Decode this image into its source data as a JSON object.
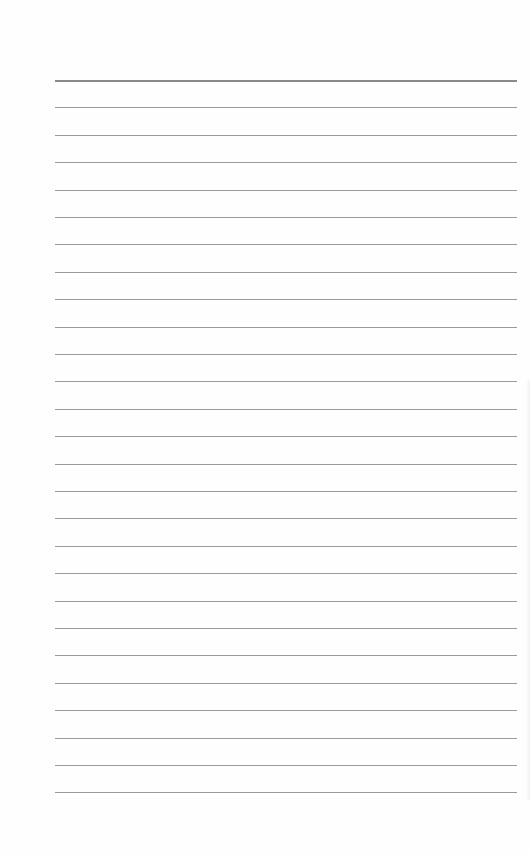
{
  "paper": {
    "type": "lined-paper",
    "background_color": "#fefefe",
    "line_color": "#9a9a9a",
    "first_line_color": "#8a8a8a",
    "line_count": 27,
    "first_line_y": 80,
    "line_spacing": 27.4,
    "line_left": 55,
    "line_width": 462
  }
}
